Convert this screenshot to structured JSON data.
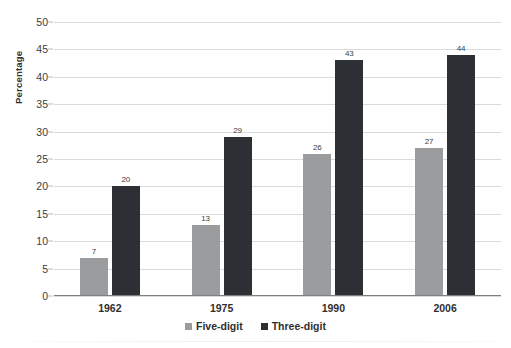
{
  "chart_data": {
    "type": "bar",
    "title": "",
    "xlabel": "",
    "ylabel": "Percentage",
    "categories": [
      "1962",
      "1975",
      "1990",
      "2006"
    ],
    "series": [
      {
        "name": "Five-digit",
        "color": "#9a9c9e",
        "values": [
          7,
          13,
          26,
          27
        ]
      },
      {
        "name": "Three-digit",
        "color": "#2c3035",
        "values": [
          20,
          29,
          43,
          44
        ]
      }
    ],
    "ylim": [
      0,
      50
    ],
    "ytick_step": 5,
    "yticks": [
      "0",
      "5",
      "10",
      "15",
      "20",
      "25",
      "30",
      "35",
      "40",
      "45",
      "50"
    ],
    "grid": true,
    "legend_position": "bottom"
  },
  "axis": {
    "y_title": "Percentage"
  },
  "legend": {
    "items": [
      {
        "label": "Five-digit"
      },
      {
        "label": "Three-digit"
      }
    ]
  },
  "colors": {
    "five_digit": "#9a9c9e",
    "three_digit": "#2c3035",
    "gridline": "#d8dadd",
    "axis": "#7d7f83",
    "background": "#ffffff"
  }
}
